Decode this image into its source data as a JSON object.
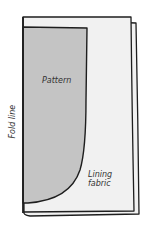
{
  "diagram": {
    "labels": {
      "pattern": "Pattern",
      "lining_line1": "Lining",
      "lining_line2": "fabric",
      "fold_line": "Fold line"
    },
    "colors": {
      "background": "#ffffff",
      "fabric_fill": "#f1f1f1",
      "pattern_fill": "#c4c4c4",
      "stroke": "#1e1e1e",
      "text": "#333333"
    }
  }
}
